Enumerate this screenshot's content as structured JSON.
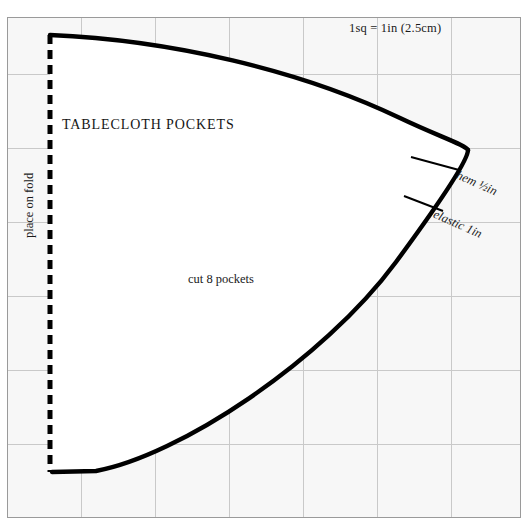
{
  "page": {
    "background_color": "#ffffff",
    "width": 531,
    "height": 525,
    "top_fragment": ""
  },
  "grid": {
    "sheet_fill": "#f7f7f7",
    "border_color": "#9a9a9a",
    "line_color": "#c9c9c9",
    "columns": 7,
    "rows": 7,
    "cell_size_px": 74,
    "scale_note": "1sq = 1in (2.5cm)"
  },
  "pattern": {
    "title": "TABLECLOTH POCKETS",
    "cut_instruction": "cut 8 pockets",
    "fold_instruction": "place on fold",
    "outline_color": "#000000",
    "fill_color": "#ffffff",
    "annotations": [
      {
        "label_prefix": "hem ",
        "fraction": "½",
        "label_suffix": "in",
        "full": "hem ½in"
      },
      {
        "label_prefix": "elastic ",
        "fraction": "",
        "label_suffix": "1in",
        "full": "elastic 1in"
      }
    ],
    "hem_label_prefix": "hem ",
    "hem_label_fraction": "½",
    "hem_label_suffix": "in",
    "elastic_label": "elastic 1in"
  }
}
